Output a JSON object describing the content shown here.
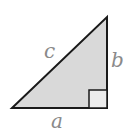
{
  "diagram": {
    "type": "right-triangle",
    "labels": {
      "hypotenuse": "c",
      "vertical_leg": "b",
      "horizontal_leg": "a"
    },
    "colors": {
      "fill": "#d9d9d9",
      "stroke": "#1a1a1a",
      "right_angle_fill": "#ececec",
      "label": "#8a8a8a"
    }
  }
}
